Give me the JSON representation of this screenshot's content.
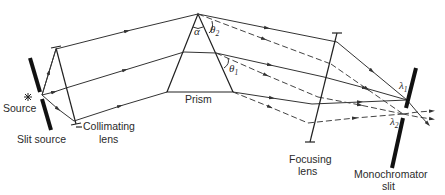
{
  "diagram": {
    "labels": {
      "source": "Source",
      "slit_source": "Slit source",
      "collimating_lens_line1": "Collimating",
      "collimating_lens_line2": "lens",
      "prism": "Prism",
      "focusing_lens_line1": "Focusing",
      "focusing_lens_line2": "lens",
      "monochromator_slit_line1": "Monochromator",
      "monochromator_slit_line2": "slit"
    },
    "symbols": {
      "alpha": "α",
      "theta": "θ",
      "theta1_sub": "1",
      "theta2_sub": "2",
      "lambda": "λ",
      "lambda1_sub": "1",
      "lambda2_sub": "2"
    },
    "legend": {
      "solid_ray": "wavelength λ1",
      "dashed_ray": "wavelength λ2"
    }
  }
}
